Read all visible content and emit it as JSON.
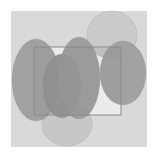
{
  "diagram": {
    "background": {
      "x": 11,
      "y": 11,
      "width": 136,
      "height": 136,
      "fill": "#d9d9d9"
    },
    "rectangle": {
      "x": 34,
      "y": 47,
      "width": 87,
      "height": 68,
      "fill": "#ffffff",
      "stroke": "#8a8a8a"
    },
    "ellipses": [
      {
        "name": "ellipse-top-right-light",
        "cx": 112,
        "cy": 35,
        "rx": 25,
        "ry": 24,
        "fill": "#c9c9c9"
      },
      {
        "name": "ellipse-bottom-light",
        "cx": 67,
        "cy": 124,
        "rx": 25,
        "ry": 22,
        "fill": "#c6c6c6"
      },
      {
        "name": "ellipse-left",
        "cx": 36,
        "cy": 80,
        "rx": 24,
        "ry": 41,
        "fill": "#9c9c9c"
      },
      {
        "name": "ellipse-mid-left",
        "cx": 62,
        "cy": 86,
        "rx": 19,
        "ry": 32,
        "fill": "#929292"
      },
      {
        "name": "ellipse-center",
        "cx": 79,
        "cy": 78,
        "rx": 21,
        "ry": 41,
        "fill": "#9a9a9a"
      },
      {
        "name": "ellipse-right",
        "cx": 123,
        "cy": 73,
        "rx": 23,
        "ry": 32,
        "fill": "#9d9d9d"
      }
    ]
  }
}
